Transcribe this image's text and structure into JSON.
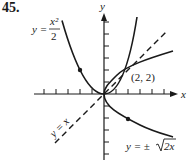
{
  "problem_number": "45.",
  "axes": {
    "x_label": "x",
    "y_label": "y",
    "origin_px": [
      104,
      94
    ],
    "unit_px": 12,
    "x_ticks": [
      -5,
      -4,
      -3,
      -2,
      -1,
      1,
      2,
      3,
      4,
      5
    ],
    "y_ticks": [
      -5,
      -4,
      -3,
      -2,
      -1,
      1,
      2,
      3,
      4,
      5,
      6
    ]
  },
  "curves": {
    "parabola_label": "y =",
    "parabola_num": "x²",
    "parabola_den": "2",
    "sqrt_label_prefix": "y = ±",
    "sqrt_label_radicand": "2x",
    "line_label": "y = x"
  },
  "intersection_label": "(2, 2)",
  "colors": {
    "ink": "#1a1a1a",
    "background": "#ffffff"
  }
}
